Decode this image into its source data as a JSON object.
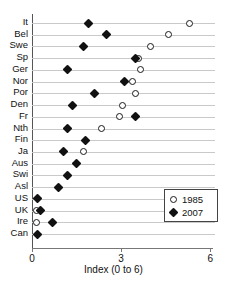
{
  "chart_data": {
    "type": "scatter",
    "title": "",
    "xlabel": "Index (0 to 6)",
    "ylabel": "",
    "xlim": [
      0,
      6.3
    ],
    "xticks": [
      0,
      3,
      6
    ],
    "xtick_labels": [
      "0",
      "3",
      "6"
    ],
    "grid": "horizontal",
    "legend_position": "lower-right",
    "orientation": "horizontal-dot-plot",
    "categories": [
      "It",
      "Bel",
      "Swe",
      "Sp",
      "Ger",
      "Nor",
      "Por",
      "Den",
      "Fr",
      "Nth",
      "Fin",
      "Ja",
      "Aus",
      "Swi",
      "Asl",
      "US",
      "UK",
      "Ire",
      "Can"
    ],
    "series": [
      {
        "name": "1985",
        "marker": "open-circle",
        "color": "#111111",
        "values": [
          5.3,
          4.6,
          4.0,
          3.6,
          3.65,
          3.4,
          3.5,
          3.05,
          2.95,
          2.35,
          null,
          1.75,
          null,
          null,
          null,
          null,
          0.15,
          0.15,
          null
        ]
      },
      {
        "name": "2007",
        "marker": "filled-diamond",
        "color": "#111111",
        "values": [
          1.9,
          2.5,
          1.75,
          3.5,
          1.2,
          3.1,
          2.1,
          1.35,
          3.5,
          1.2,
          1.8,
          1.05,
          1.5,
          1.2,
          0.9,
          0.2,
          0.3,
          0.7,
          0.2
        ]
      }
    ]
  },
  "legend": {
    "items": [
      {
        "label": "1985",
        "marker": "open-circle"
      },
      {
        "label": "2007",
        "marker": "filled-diamond"
      }
    ]
  }
}
